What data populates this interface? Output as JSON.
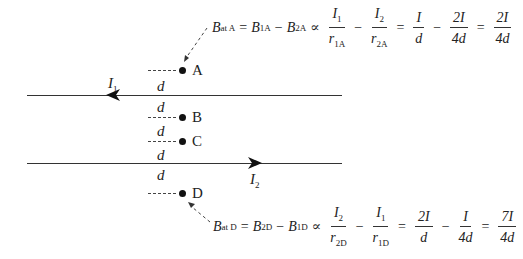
{
  "wires": {
    "wire1": {
      "current_label": "I",
      "current_sub": "1",
      "direction": "left"
    },
    "wire2": {
      "current_label": "I",
      "current_sub": "2",
      "direction": "right"
    }
  },
  "points": {
    "A": "A",
    "B": "B",
    "C": "C",
    "D": "D"
  },
  "spacing_label": "d",
  "equation_A": {
    "lhs": "B",
    "lhs_sub": "at A",
    "t1": "B",
    "t1_sub": "1A",
    "minus": "−",
    "t2": "B",
    "t2_sub": "2A",
    "prop": "∝",
    "f1_num": "I",
    "f1_num_sub": "1",
    "f1_den": "r",
    "f1_den_sub": "1A",
    "f2_num": "I",
    "f2_num_sub": "2",
    "f2_den": "r",
    "f2_den_sub": "2A",
    "f3_num": "I",
    "f3_den": "d",
    "f4_num": "2I",
    "f4_den": "4d",
    "f5_num": "2I",
    "f5_den": "4d",
    "eq": "="
  },
  "equation_D": {
    "lhs": "B",
    "lhs_sub": "at D",
    "t1": "B",
    "t1_sub": "2D",
    "minus": "−",
    "t2": "B",
    "t2_sub": "1D",
    "prop": "∝",
    "f1_num": "I",
    "f1_num_sub": "2",
    "f1_den": "r",
    "f1_den_sub": "2D",
    "f2_num": "I",
    "f2_num_sub": "1",
    "f2_den": "r",
    "f2_den_sub": "1D",
    "f3_num": "2I",
    "f3_den": "d",
    "f4_num": "I",
    "f4_den": "4d",
    "f5_num": "7I",
    "f5_den": "4d",
    "eq": "="
  }
}
